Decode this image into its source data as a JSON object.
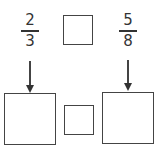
{
  "fractions": [
    {
      "numerator": "2",
      "denominator": "3"
    },
    {
      "numerator": "5",
      "denominator": "8"
    }
  ],
  "boxes": {
    "top_compare": "",
    "bottom_left": "",
    "bottom_middle": "",
    "bottom_right": ""
  },
  "colors": {
    "stroke": "#444444",
    "text": "#333333",
    "background": "#ffffff"
  }
}
